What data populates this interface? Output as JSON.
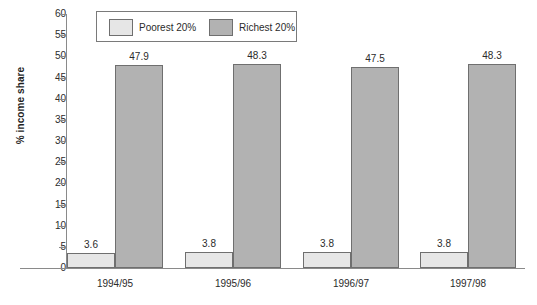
{
  "chart_data": {
    "type": "bar",
    "title": "",
    "subtitle": "",
    "xlabel": "",
    "ylabel": "% income share",
    "categories": [
      "1994/95",
      "1995/96",
      "1996/97",
      "1997/98"
    ],
    "series": [
      {
        "name": "Poorest 20%",
        "values": [
          3.6,
          3.8,
          3.8,
          3.8
        ],
        "color": "#e6e6e6"
      },
      {
        "name": "Richest 20%",
        "values": [
          47.9,
          48.3,
          47.5,
          48.3
        ],
        "color": "#b2b2b2"
      }
    ],
    "value_labels": {
      "poorest": [
        "3.6",
        "3.8",
        "3.8",
        "3.8"
      ],
      "richest": [
        "47.9",
        "48.3",
        "47.5",
        "48.3"
      ]
    },
    "ylim": [
      0,
      60
    ],
    "ytick_labels": [
      "60",
      "55",
      "50",
      "45",
      "40",
      "35",
      "30",
      "25",
      "20",
      "15",
      "10",
      "5",
      "0"
    ],
    "ytick_values": [
      60,
      55,
      50,
      45,
      40,
      35,
      30,
      25,
      20,
      15,
      10,
      5,
      0
    ],
    "grid": false,
    "legend_position": "top-center",
    "axis_color": "#8a8a8a",
    "bar_edge_color": "#6f6f6f",
    "text_color": "#2b2b2b"
  },
  "legend": {
    "entries": [
      {
        "label": "Poorest 20%",
        "swatch": "poorest-swatch"
      },
      {
        "label": "Richest 20%",
        "swatch": "richest-swatch"
      }
    ]
  }
}
